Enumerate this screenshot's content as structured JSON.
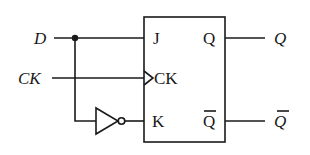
{
  "diagram": {
    "type": "JK flip-flop configured as D flip-flop",
    "inputs": {
      "d_label": "D",
      "ck_label": "CK"
    },
    "flipflop": {
      "pin_j": "J",
      "pin_ck": "CK",
      "pin_k": "K",
      "pin_q": "Q",
      "pin_qbar": "Q"
    },
    "outputs": {
      "q_label": "Q",
      "qbar_label": "Q"
    },
    "components": [
      "junction-dot",
      "inverter",
      "jk-flipflop"
    ],
    "colors": {
      "line": "#1a1a1a",
      "background": "#ffffff"
    }
  }
}
